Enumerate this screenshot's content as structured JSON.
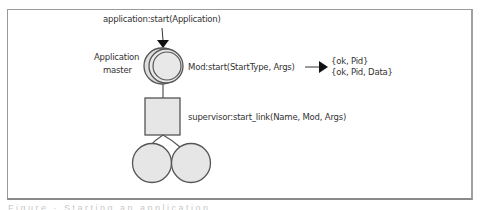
{
  "diagram": {
    "top_call": "application:start(Application)",
    "app_master_label_line1": "Application",
    "app_master_label_line2": "master",
    "mod_start_call": "Mod:start(StartType, Args)",
    "return_values": [
      "{ok, Pid}",
      "{ok, Pid, Data}"
    ],
    "supervisor_call": "supervisor:start_link(Name, Mod, Args)",
    "nodes": {
      "application_master": {
        "shape": "double-circle",
        "color": "#e6e6e6"
      },
      "supervisor": {
        "shape": "square",
        "color": "#e6e6e6"
      },
      "workers": [
        {
          "shape": "circle",
          "color": "#e6e6e6"
        },
        {
          "shape": "circle",
          "color": "#e6e6e6"
        }
      ]
    },
    "colors": {
      "stroke": "#555555",
      "fill": "#e6e6e6",
      "frame": "#9a9a9a",
      "text": "#333333"
    }
  },
  "caption": "Figure  ·  Starting  an  application"
}
